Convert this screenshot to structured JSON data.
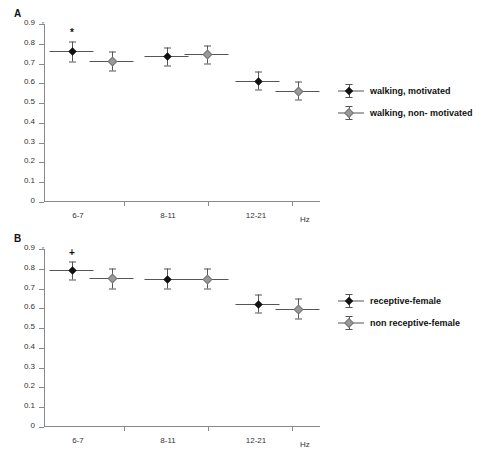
{
  "figure": {
    "panels": [
      {
        "letter": "A",
        "ylabel": "r",
        "xunit": "Hz",
        "yticks": [
          "0.9",
          "0.8",
          "0.7",
          "0.6",
          "0.5",
          "0.4",
          "0.3",
          "0.2",
          "0.1",
          "0"
        ],
        "xticks": [
          "6-7",
          "8-11",
          "12-21"
        ],
        "legend": [
          {
            "label": "walking, motivated",
            "marker": "filled-diamond"
          },
          {
            "label": "walking, non- motivated",
            "marker": "open-diamond"
          }
        ],
        "annotations": [
          {
            "symbol": "*",
            "group": "6-7",
            "series": "walking, motivated"
          }
        ]
      },
      {
        "letter": "B",
        "ylabel": "r",
        "xunit": "Hz",
        "yticks": [
          "0.9",
          "0.8",
          "0.7",
          "0.6",
          "0.5",
          "0.4",
          "0.3",
          "0.2",
          "0.1",
          "0"
        ],
        "xticks": [
          "6-7",
          "8-11",
          "12-21"
        ],
        "legend": [
          {
            "label": "receptive-female",
            "marker": "filled-diamond"
          },
          {
            "label": "non receptive-female",
            "marker": "open-diamond"
          }
        ],
        "annotations": [
          {
            "symbol": "+",
            "group": "6-7",
            "series": "receptive-female"
          }
        ]
      }
    ]
  },
  "chart_data": [
    {
      "type": "scatter",
      "panel": "A",
      "title": "",
      "xlabel": "Hz",
      "ylabel": "r",
      "categories": [
        "6-7",
        "8-11",
        "12-21"
      ],
      "ylim": [
        0,
        0.9
      ],
      "yticks": [
        0,
        0.1,
        0.2,
        0.3,
        0.4,
        0.5,
        0.6,
        0.7,
        0.8,
        0.9
      ],
      "grid": false,
      "legend_position": "right",
      "series": [
        {
          "name": "walking, motivated",
          "marker": "filled-diamond",
          "values": [
            0.76,
            0.735,
            0.61
          ],
          "errors": [
            0.05,
            0.045,
            0.045
          ],
          "significance": [
            "*",
            "",
            ""
          ]
        },
        {
          "name": "walking, non- motivated",
          "marker": "open-diamond",
          "values": [
            0.71,
            0.745,
            0.56
          ],
          "errors": [
            0.05,
            0.045,
            0.045
          ],
          "significance": [
            "",
            "",
            ""
          ]
        }
      ]
    },
    {
      "type": "scatter",
      "panel": "B",
      "title": "",
      "xlabel": "Hz",
      "ylabel": "r",
      "categories": [
        "6-7",
        "8-11",
        "12-21"
      ],
      "ylim": [
        0,
        0.9
      ],
      "yticks": [
        0,
        0.1,
        0.2,
        0.3,
        0.4,
        0.5,
        0.6,
        0.7,
        0.8,
        0.9
      ],
      "grid": false,
      "legend_position": "right",
      "series": [
        {
          "name": "receptive-female",
          "marker": "filled-diamond",
          "values": [
            0.79,
            0.748,
            0.62
          ],
          "errors": [
            0.045,
            0.05,
            0.045
          ],
          "significance": [
            "+",
            "",
            ""
          ]
        },
        {
          "name": "non receptive-female",
          "marker": "open-diamond",
          "values": [
            0.75,
            0.748,
            0.595
          ],
          "errors": [
            0.05,
            0.05,
            0.05
          ],
          "significance": [
            "",
            "",
            ""
          ]
        }
      ]
    }
  ]
}
